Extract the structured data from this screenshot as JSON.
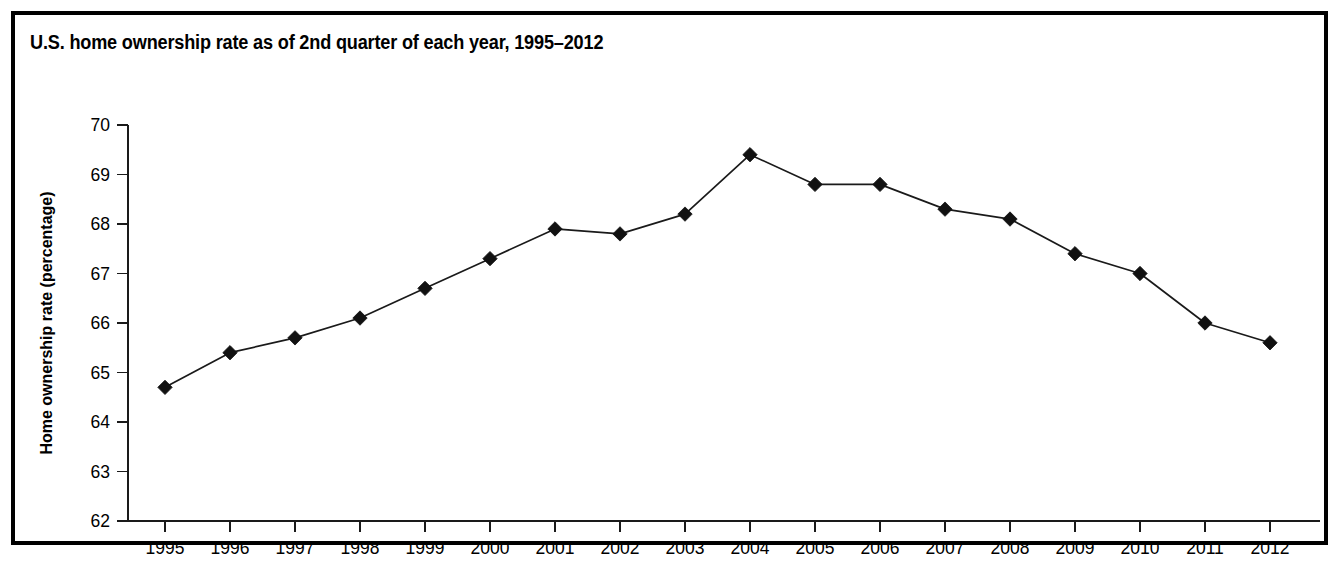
{
  "figure": {
    "title": "U.S. home ownership rate as of 2nd quarter of each year, 1995–2012",
    "border_color": "#000000",
    "background_color": "#ffffff",
    "line_color": "#1a1a1a",
    "marker_color": "#111111",
    "cutoff_caption": ""
  },
  "chart_data": {
    "type": "line",
    "title": "U.S. home ownership rate as of 2nd quarter of each year, 1995–2012",
    "xlabel": "",
    "ylabel": "Home ownership rate (percentage)",
    "categories": [
      "1995",
      "1996",
      "1997",
      "1998",
      "1999",
      "2000",
      "2001",
      "2002",
      "2003",
      "2004",
      "2005",
      "2006",
      "2007",
      "2008",
      "2009",
      "2010",
      "2011",
      "2012"
    ],
    "values": [
      64.7,
      65.4,
      65.7,
      66.1,
      66.7,
      67.3,
      67.9,
      67.8,
      68.2,
      69.4,
      68.8,
      68.8,
      68.3,
      68.1,
      67.4,
      67.0,
      66.0,
      65.6
    ],
    "x": [
      1995,
      1996,
      1997,
      1998,
      1999,
      2000,
      2001,
      2002,
      2003,
      2004,
      2005,
      2006,
      2007,
      2008,
      2009,
      2010,
      2011,
      2012
    ],
    "ylim": [
      62,
      70
    ],
    "yticks": [
      62,
      63,
      64,
      65,
      66,
      67,
      68,
      69,
      70
    ],
    "ytick_labels": [
      "62",
      "63",
      "64",
      "65",
      "66",
      "67",
      "68",
      "69",
      "70"
    ],
    "xtick_labels": [
      "1995",
      "1996",
      "1997",
      "1998",
      "1999",
      "2000",
      "2001",
      "2002",
      "2003",
      "2004",
      "2005",
      "2006",
      "2007",
      "2008",
      "2009",
      "2010",
      "2011",
      "2012"
    ],
    "grid": false,
    "legend": false,
    "marker": "diamond",
    "series": [
      {
        "name": "Home ownership rate",
        "values": [
          64.7,
          65.4,
          65.7,
          66.1,
          66.7,
          67.3,
          67.9,
          67.8,
          68.2,
          69.4,
          68.8,
          68.8,
          68.3,
          68.1,
          67.4,
          67.0,
          66.0,
          65.6
        ]
      }
    ]
  }
}
